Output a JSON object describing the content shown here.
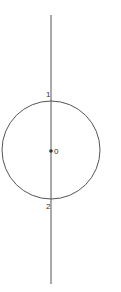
{
  "diagram": {
    "colors": {
      "stroke": "#555555",
      "text": "#333333",
      "background": "#ffffff"
    },
    "points": [
      {
        "id": "center",
        "label": "0"
      },
      {
        "id": "top-intersection",
        "label": "1"
      },
      {
        "id": "bottom-intersection",
        "label": "2"
      }
    ]
  }
}
